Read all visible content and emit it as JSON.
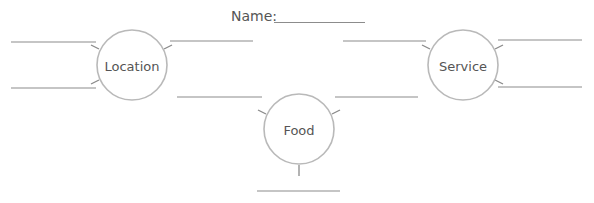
{
  "header": {
    "name_label": "Name:"
  },
  "nodes": [
    {
      "id": "location",
      "label": "Location"
    },
    {
      "id": "food",
      "label": "Food"
    },
    {
      "id": "service",
      "label": "Service"
    }
  ],
  "colors": {
    "line": "#8c8c8c",
    "circle": "#b9b9b9",
    "text": "#555555"
  }
}
